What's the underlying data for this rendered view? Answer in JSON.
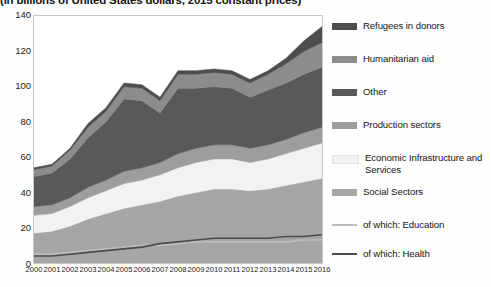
{
  "chart_data": {
    "type": "area",
    "title": "(in billions of United States dollars, 2015 constant prices)",
    "xlabel": "",
    "ylabel": "",
    "ylim": [
      0,
      140
    ],
    "ytick_values": [
      0,
      20,
      40,
      60,
      80,
      100,
      120,
      140
    ],
    "ytick_labels": [
      "0",
      "20",
      "40",
      "60",
      "80",
      "100",
      "120",
      "140"
    ],
    "grid": false,
    "legend_position": "right",
    "stacked": true,
    "categories": [
      "2000",
      "2001",
      "2002",
      "2003",
      "2004",
      "2005",
      "2006",
      "2007",
      "2008",
      "2009",
      "2010",
      "2011",
      "2012",
      "2013",
      "2014",
      "2015",
      "2016"
    ],
    "series": [
      {
        "name": "Social Sectors",
        "color": "#a6a6a6",
        "values": [
          17,
          18,
          21,
          25,
          28,
          31,
          33,
          35,
          38,
          40,
          42,
          42,
          41,
          42,
          44,
          46,
          48
        ]
      },
      {
        "name": "Economic Infrastructure and Services",
        "color": "#f2f2f2",
        "values": [
          10,
          10,
          11,
          12,
          13,
          14,
          14,
          15,
          16,
          17,
          17,
          17,
          16,
          17,
          18,
          19,
          20
        ]
      },
      {
        "name": "Production sectors",
        "color": "#9d9d9d",
        "values": [
          5,
          5,
          5,
          6,
          6,
          7,
          7,
          7,
          8,
          8,
          8,
          8,
          8,
          8,
          8,
          9,
          9
        ]
      },
      {
        "name": "Other",
        "color": "#595959",
        "values": [
          17,
          18,
          22,
          28,
          33,
          41,
          38,
          28,
          37,
          34,
          33,
          32,
          29,
          31,
          32,
          33,
          34
        ]
      },
      {
        "name": "Humanitarian aid",
        "color": "#8c8c8c",
        "values": [
          4,
          4,
          5,
          6,
          6,
          7,
          7,
          7,
          8,
          8,
          8,
          8,
          8,
          9,
          11,
          13,
          14
        ]
      },
      {
        "name": "Refugees in donors",
        "color": "#4d4d4d",
        "values": [
          1,
          1,
          1,
          2,
          2,
          2,
          2,
          2,
          2,
          2,
          2,
          2,
          2,
          2,
          3,
          6,
          9
        ]
      }
    ],
    "overlay_lines": [
      {
        "name": "of which: Education",
        "color": "#bdbdbd",
        "values": [
          5,
          5,
          6,
          7,
          8,
          9,
          10,
          10,
          11,
          12,
          12,
          12,
          12,
          12,
          12,
          13,
          13
        ]
      },
      {
        "name": "of which: Health",
        "color": "#4d4d4d",
        "values": [
          4,
          4,
          5,
          6,
          7,
          8,
          9,
          11,
          12,
          13,
          14,
          14,
          14,
          14,
          15,
          15,
          16
        ]
      }
    ]
  },
  "legend": {
    "items": [
      {
        "label": "Refugees in donors",
        "color": "#4d4d4d",
        "type": "area"
      },
      {
        "label": "Humanitarian aid",
        "color": "#8c8c8c",
        "type": "area"
      },
      {
        "label": "Other",
        "color": "#595959",
        "type": "area"
      },
      {
        "label": "Production sectors",
        "color": "#9d9d9d",
        "type": "area"
      },
      {
        "label": "Economic Infrastructure and Services",
        "color": "#f2f2f2",
        "type": "area"
      },
      {
        "label": "Social Sectors",
        "color": "#a6a6a6",
        "type": "area"
      },
      {
        "label": "of which: Education",
        "color": "#bdbdbd",
        "type": "line"
      },
      {
        "label": "of which: Health",
        "color": "#4d4d4d",
        "type": "line"
      }
    ]
  }
}
